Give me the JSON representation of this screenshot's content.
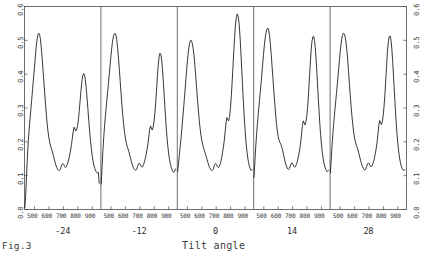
{
  "figure": {
    "caption": "Fig.3",
    "xtitle": "Tilt angle"
  },
  "axes": {
    "y_ticks": [
      "0.6",
      "0.5",
      "0.4",
      "0.3",
      "0.2",
      "0.1",
      "0.0"
    ],
    "y_ticks_right": [
      "0.6",
      "0.5",
      "0.4",
      "0.3",
      "0.2",
      "0.1",
      "0.0"
    ],
    "x_ticks": [
      "500",
      "600",
      "700",
      "800",
      "900"
    ]
  },
  "chart_data": {
    "type": "line",
    "title": "Fig.3",
    "xlabel": "Tilt angle",
    "ylabel": "",
    "ylim": [
      0.0,
      0.6
    ],
    "xlim": [
      430,
      960
    ],
    "grid": false,
    "legend": "none",
    "panel_axis_ticks": [
      500,
      600,
      700,
      800,
      900
    ],
    "panels": [
      {
        "label": "-24",
        "tilt_angle": -24,
        "x": [
          432,
          438,
          444,
          450,
          456,
          462,
          468,
          474,
          480,
          486,
          492,
          498,
          504,
          510,
          516,
          522,
          528,
          534,
          540,
          546,
          552,
          558,
          564,
          570,
          576,
          582,
          588,
          594,
          600,
          606,
          612,
          618,
          624,
          630,
          636,
          642,
          648,
          654,
          660,
          666,
          672,
          678,
          684,
          690,
          696,
          702,
          708,
          714,
          720,
          726,
          732,
          738,
          744,
          750,
          756,
          762,
          768,
          774,
          780,
          786,
          792,
          798,
          804,
          810,
          816,
          822,
          828,
          834,
          840,
          846,
          852,
          858,
          864,
          870,
          876,
          882,
          888,
          894,
          900,
          906,
          912,
          918,
          924,
          930,
          936,
          942,
          948
        ],
        "y": [
          0.005,
          0.04,
          0.1,
          0.155,
          0.2,
          0.235,
          0.265,
          0.295,
          0.325,
          0.355,
          0.385,
          0.415,
          0.445,
          0.475,
          0.5,
          0.515,
          0.521,
          0.518,
          0.505,
          0.48,
          0.45,
          0.415,
          0.38,
          0.345,
          0.31,
          0.278,
          0.25,
          0.228,
          0.21,
          0.196,
          0.186,
          0.178,
          0.17,
          0.16,
          0.15,
          0.14,
          0.131,
          0.124,
          0.119,
          0.116,
          0.115,
          0.118,
          0.126,
          0.133,
          0.136,
          0.133,
          0.127,
          0.124,
          0.126,
          0.132,
          0.14,
          0.15,
          0.162,
          0.176,
          0.192,
          0.212,
          0.232,
          0.243,
          0.238,
          0.232,
          0.236,
          0.248,
          0.266,
          0.292,
          0.322,
          0.352,
          0.378,
          0.396,
          0.402,
          0.398,
          0.384,
          0.36,
          0.33,
          0.296,
          0.262,
          0.23,
          0.202,
          0.178,
          0.158,
          0.142,
          0.13,
          0.121,
          0.114,
          0.11,
          0.108,
          0.11,
          0.078
        ]
      },
      {
        "label": "-12",
        "tilt_angle": -12,
        "x": [
          432,
          438,
          444,
          450,
          456,
          462,
          468,
          474,
          480,
          486,
          492,
          498,
          504,
          510,
          516,
          522,
          528,
          534,
          540,
          546,
          552,
          558,
          564,
          570,
          576,
          582,
          588,
          594,
          600,
          606,
          612,
          618,
          624,
          630,
          636,
          642,
          648,
          654,
          660,
          666,
          672,
          678,
          684,
          690,
          696,
          702,
          708,
          714,
          720,
          726,
          732,
          738,
          744,
          750,
          756,
          762,
          768,
          774,
          780,
          786,
          792,
          798,
          804,
          810,
          816,
          822,
          828,
          834,
          840,
          846,
          852,
          858,
          864,
          870,
          876,
          882,
          888,
          894,
          900,
          906,
          912,
          918,
          924,
          930,
          936,
          942,
          948
        ],
        "y": [
          0.075,
          0.125,
          0.175,
          0.215,
          0.25,
          0.28,
          0.308,
          0.335,
          0.362,
          0.39,
          0.418,
          0.446,
          0.472,
          0.494,
          0.51,
          0.518,
          0.521,
          0.516,
          0.502,
          0.478,
          0.448,
          0.414,
          0.378,
          0.342,
          0.308,
          0.277,
          0.25,
          0.228,
          0.211,
          0.197,
          0.187,
          0.179,
          0.171,
          0.161,
          0.151,
          0.141,
          0.132,
          0.125,
          0.12,
          0.117,
          0.116,
          0.119,
          0.127,
          0.134,
          0.137,
          0.134,
          0.128,
          0.125,
          0.127,
          0.133,
          0.141,
          0.151,
          0.163,
          0.177,
          0.193,
          0.214,
          0.236,
          0.247,
          0.241,
          0.235,
          0.242,
          0.258,
          0.282,
          0.314,
          0.352,
          0.394,
          0.428,
          0.452,
          0.462,
          0.458,
          0.44,
          0.41,
          0.372,
          0.33,
          0.288,
          0.25,
          0.216,
          0.188,
          0.165,
          0.147,
          0.134,
          0.124,
          0.117,
          0.112,
          0.11,
          0.114,
          0.12
        ]
      },
      {
        "label": "0",
        "tilt_angle": 0,
        "x": [
          432,
          438,
          444,
          450,
          456,
          462,
          468,
          474,
          480,
          486,
          492,
          498,
          504,
          510,
          516,
          522,
          528,
          534,
          540,
          546,
          552,
          558,
          564,
          570,
          576,
          582,
          588,
          594,
          600,
          606,
          612,
          618,
          624,
          630,
          636,
          642,
          648,
          654,
          660,
          666,
          672,
          678,
          684,
          690,
          696,
          702,
          708,
          714,
          720,
          726,
          732,
          738,
          744,
          750,
          756,
          762,
          768,
          774,
          780,
          786,
          792,
          798,
          804,
          810,
          816,
          822,
          828,
          834,
          840,
          846,
          852,
          858,
          864,
          870,
          876,
          882,
          888,
          894,
          900,
          906,
          912,
          918,
          924,
          930,
          936,
          942,
          948
        ],
        "y": [
          0.112,
          0.135,
          0.16,
          0.186,
          0.212,
          0.24,
          0.27,
          0.3,
          0.332,
          0.365,
          0.398,
          0.428,
          0.456,
          0.478,
          0.493,
          0.5,
          0.499,
          0.491,
          0.476,
          0.454,
          0.426,
          0.394,
          0.36,
          0.326,
          0.294,
          0.265,
          0.24,
          0.22,
          0.204,
          0.192,
          0.182,
          0.174,
          0.166,
          0.157,
          0.148,
          0.139,
          0.131,
          0.124,
          0.119,
          0.116,
          0.115,
          0.118,
          0.126,
          0.133,
          0.136,
          0.133,
          0.127,
          0.124,
          0.126,
          0.133,
          0.142,
          0.154,
          0.168,
          0.185,
          0.205,
          0.23,
          0.256,
          0.272,
          0.266,
          0.262,
          0.272,
          0.296,
          0.33,
          0.374,
          0.42,
          0.468,
          0.512,
          0.548,
          0.57,
          0.578,
          0.572,
          0.552,
          0.518,
          0.474,
          0.424,
          0.372,
          0.322,
          0.276,
          0.236,
          0.202,
          0.176,
          0.155,
          0.139,
          0.128,
          0.12,
          0.115,
          0.118
        ]
      },
      {
        "label": "14",
        "tilt_angle": 14,
        "x": [
          432,
          438,
          444,
          450,
          456,
          462,
          468,
          474,
          480,
          486,
          492,
          498,
          504,
          510,
          516,
          522,
          528,
          534,
          540,
          546,
          552,
          558,
          564,
          570,
          576,
          582,
          588,
          594,
          600,
          606,
          612,
          618,
          624,
          630,
          636,
          642,
          648,
          654,
          660,
          666,
          672,
          678,
          684,
          690,
          696,
          702,
          708,
          714,
          720,
          726,
          732,
          738,
          744,
          750,
          756,
          762,
          768,
          774,
          780,
          786,
          792,
          798,
          804,
          810,
          816,
          822,
          828,
          834,
          840,
          846,
          852,
          858,
          864,
          870,
          876,
          882,
          888,
          894,
          900,
          906,
          912,
          918,
          924,
          930,
          936,
          942,
          948
        ],
        "y": [
          0.095,
          0.14,
          0.185,
          0.222,
          0.255,
          0.284,
          0.312,
          0.34,
          0.368,
          0.398,
          0.428,
          0.458,
          0.486,
          0.508,
          0.524,
          0.533,
          0.536,
          0.53,
          0.514,
          0.488,
          0.456,
          0.42,
          0.384,
          0.348,
          0.314,
          0.282,
          0.254,
          0.232,
          0.216,
          0.205,
          0.198,
          0.193,
          0.186,
          0.176,
          0.164,
          0.152,
          0.141,
          0.132,
          0.125,
          0.12,
          0.118,
          0.121,
          0.129,
          0.136,
          0.138,
          0.134,
          0.128,
          0.125,
          0.127,
          0.133,
          0.141,
          0.152,
          0.165,
          0.18,
          0.198,
          0.222,
          0.248,
          0.262,
          0.256,
          0.25,
          0.258,
          0.276,
          0.302,
          0.338,
          0.382,
          0.428,
          0.468,
          0.496,
          0.51,
          0.512,
          0.5,
          0.474,
          0.436,
          0.392,
          0.346,
          0.3,
          0.258,
          0.222,
          0.192,
          0.168,
          0.15,
          0.136,
          0.126,
          0.119,
          0.114,
          0.112,
          0.116
        ]
      },
      {
        "label": "28",
        "tilt_angle": 28,
        "x": [
          432,
          438,
          444,
          450,
          456,
          462,
          468,
          474,
          480,
          486,
          492,
          498,
          504,
          510,
          516,
          522,
          528,
          534,
          540,
          546,
          552,
          558,
          564,
          570,
          576,
          582,
          588,
          594,
          600,
          606,
          612,
          618,
          624,
          630,
          636,
          642,
          648,
          654,
          660,
          666,
          672,
          678,
          684,
          690,
          696,
          702,
          708,
          714,
          720,
          726,
          732,
          738,
          744,
          750,
          756,
          762,
          768,
          774,
          780,
          786,
          792,
          798,
          804,
          810,
          816,
          822,
          828,
          834,
          840,
          846,
          852,
          858,
          864,
          870,
          876,
          882,
          888,
          894,
          900,
          906,
          912,
          918,
          924,
          930,
          936,
          942,
          948
        ],
        "y": [
          0.108,
          0.15,
          0.192,
          0.228,
          0.26,
          0.288,
          0.315,
          0.342,
          0.37,
          0.398,
          0.427,
          0.456,
          0.482,
          0.502,
          0.515,
          0.521,
          0.519,
          0.511,
          0.496,
          0.472,
          0.442,
          0.408,
          0.372,
          0.337,
          0.304,
          0.274,
          0.248,
          0.227,
          0.211,
          0.199,
          0.19,
          0.183,
          0.175,
          0.165,
          0.154,
          0.144,
          0.135,
          0.127,
          0.122,
          0.118,
          0.117,
          0.12,
          0.128,
          0.135,
          0.138,
          0.135,
          0.129,
          0.126,
          0.128,
          0.134,
          0.142,
          0.153,
          0.166,
          0.181,
          0.199,
          0.223,
          0.249,
          0.263,
          0.257,
          0.251,
          0.259,
          0.277,
          0.303,
          0.339,
          0.382,
          0.428,
          0.468,
          0.496,
          0.511,
          0.513,
          0.502,
          0.476,
          0.438,
          0.394,
          0.348,
          0.302,
          0.26,
          0.224,
          0.194,
          0.17,
          0.152,
          0.138,
          0.128,
          0.121,
          0.117,
          0.115,
          0.118
        ]
      }
    ]
  }
}
